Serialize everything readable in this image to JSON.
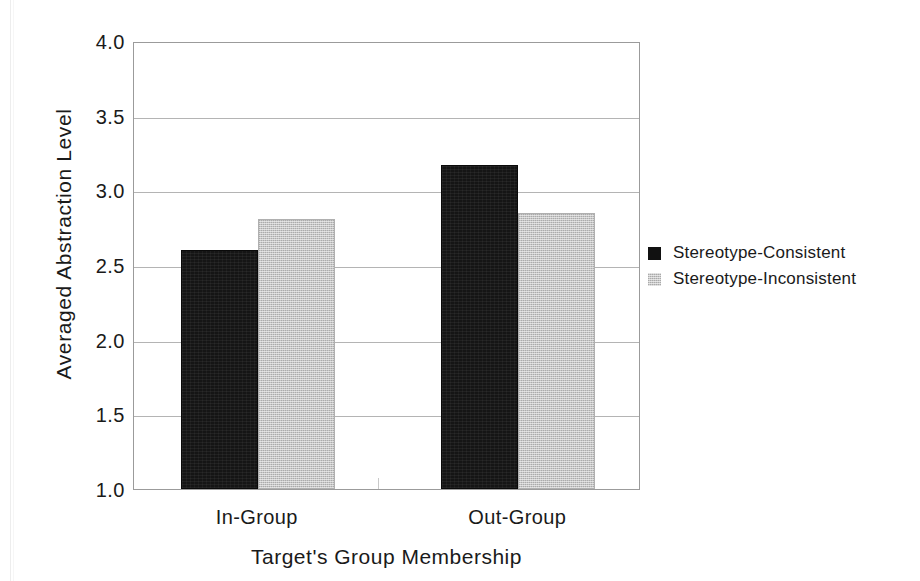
{
  "chart_data": {
    "type": "bar",
    "title": "",
    "subtitle": "",
    "xlabel": "Target's Group Membership",
    "ylabel": "Averaged Abstraction Level",
    "categories": [
      "In-Group",
      "Out-Group"
    ],
    "series": [
      {
        "name": "Stereotype-Consistent",
        "color": "#111111",
        "values": [
          2.6,
          3.17
        ]
      },
      {
        "name": "Stereotype-Inconsistent",
        "color": "#c6c6c6",
        "values": [
          2.81,
          2.85
        ]
      }
    ],
    "ylim": [
      1.0,
      4.0
    ],
    "ytick_labels": [
      "4.0",
      "3.5",
      "3.0",
      "2.5",
      "2.0",
      "1.5",
      "1.0"
    ],
    "ytick_values": [
      4.0,
      3.5,
      3.0,
      2.5,
      2.0,
      1.5,
      1.0
    ],
    "grid": true,
    "grid_axis": "y",
    "legend_position": "right",
    "bar_gap": 0
  },
  "axes": {
    "y_title": "Averaged Abstraction Level",
    "x_title": "Target's Group Membership"
  },
  "legend": {
    "entries": [
      {
        "label": "Stereotype-Consistent",
        "swatch": "black-square-icon"
      },
      {
        "label": "Stereotype-Inconsistent",
        "swatch": "gray-square-icon"
      }
    ]
  },
  "ticks": {
    "y": [
      "4.0",
      "3.5",
      "3.0",
      "2.5",
      "2.0",
      "1.5",
      "1.0"
    ],
    "x": [
      "In-Group",
      "Out-Group"
    ]
  }
}
